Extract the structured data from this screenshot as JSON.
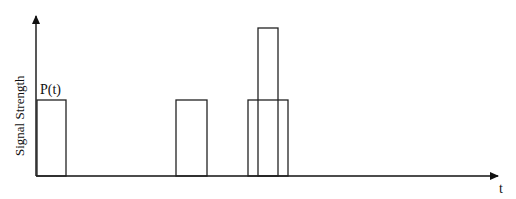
{
  "diagram": {
    "y_axis_label": "Signal Strength",
    "x_axis_label": "t",
    "pulse_label": "P(t)",
    "pulses": [
      {
        "name": "pulse-1",
        "x1": 37,
        "x2": 66,
        "top": 100
      },
      {
        "name": "pulse-2",
        "x1": 176,
        "x2": 207,
        "top": 100
      },
      {
        "name": "pulse-3-wide",
        "x1": 248,
        "x2": 288,
        "top": 100
      },
      {
        "name": "pulse-3-tall",
        "x1": 258,
        "x2": 278,
        "top": 28
      }
    ],
    "baseline_y": 176
  }
}
